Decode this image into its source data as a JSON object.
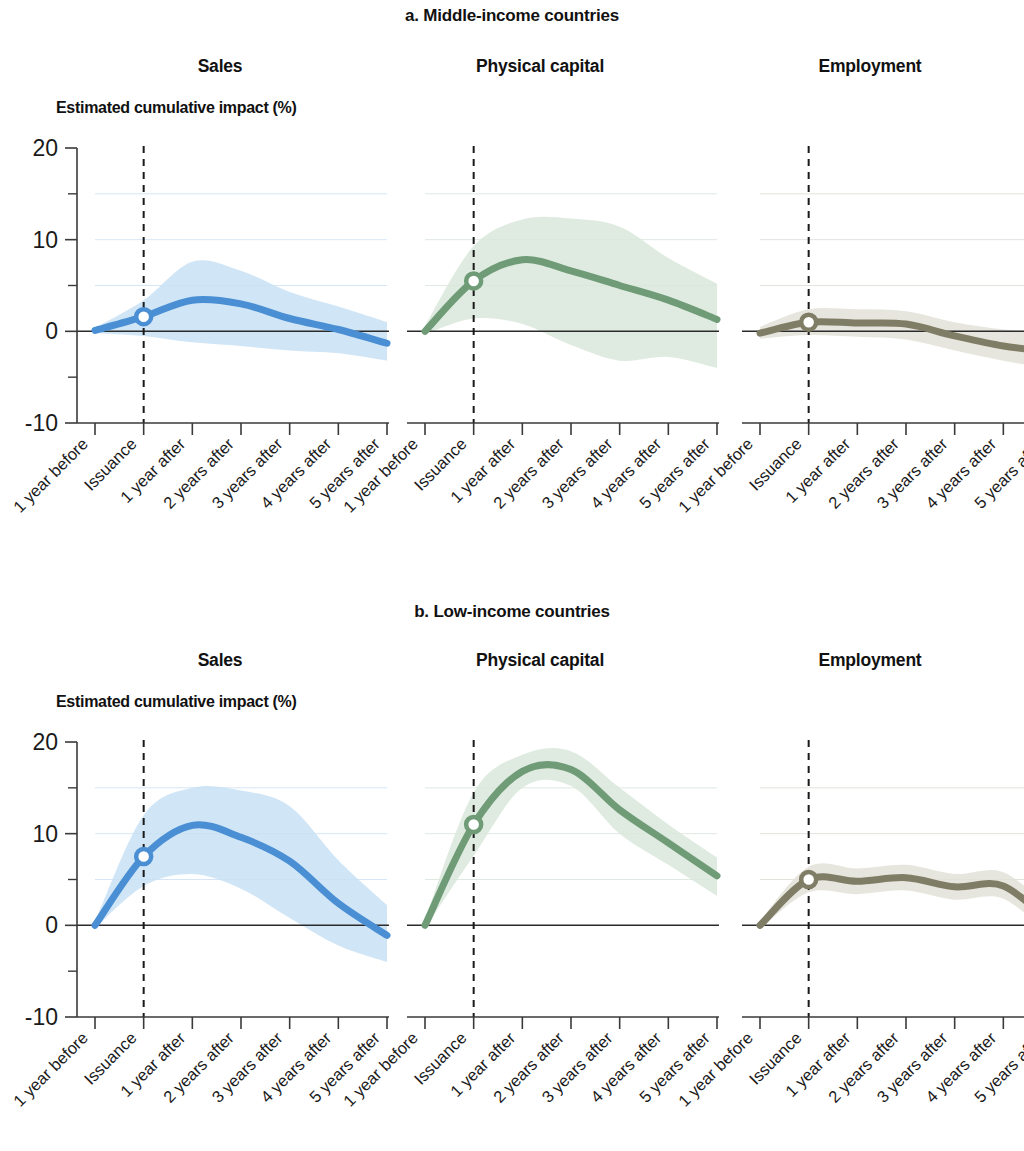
{
  "figure": {
    "sections": [
      {
        "id": "a",
        "title": "a. Middle-income countries"
      },
      {
        "id": "b",
        "title": "b. Low-income countries"
      }
    ],
    "axis_caption": "Estimated cumulative impact (%)",
    "panel_titles": [
      "Sales",
      "Physical capital",
      "Employment"
    ]
  },
  "colors": {
    "sales_line": "#4a8fd4",
    "sales_band": "#c8e1f5",
    "capital_line": "#6f9b77",
    "capital_band": "#d9e8da",
    "employment_line": "#807d66",
    "employment_band": "#e3e2d8",
    "axis": "#3a3a3a",
    "event_line": "#1a1a1a"
  },
  "chart_data": [
    {
      "type": "line",
      "title": "Sales",
      "section": "a. Middle-income countries",
      "xlabel": "",
      "ylabel": "Estimated cumulative impact (%)",
      "ylim": [
        -10,
        20
      ],
      "yticks": [
        -10,
        0,
        10,
        20
      ],
      "yticks_minor": [
        -5,
        5,
        15
      ],
      "grid": true,
      "legend": "none",
      "categories": [
        "1 year before",
        "Issuance",
        "1 year after",
        "2 years after",
        "3 years after",
        "4 years after",
        "5 years after"
      ],
      "x": [
        0,
        1,
        2,
        3,
        4,
        5,
        6
      ],
      "event_marker_x": 1,
      "event_marker_label": "Issuance",
      "series": [
        {
          "name": "Estimated cumulative impact",
          "values": [
            0.1,
            1.6,
            3.4,
            3.0,
            1.4,
            0.2,
            -1.3
          ]
        },
        {
          "name": "Upper confidence bound",
          "values": [
            0.4,
            3.4,
            7.6,
            6.6,
            4.3,
            2.7,
            1.0
          ]
        },
        {
          "name": "Lower confidence bound",
          "values": [
            -0.2,
            -0.5,
            -1.2,
            -1.6,
            -2.1,
            -2.4,
            -3.2
          ]
        }
      ]
    },
    {
      "type": "line",
      "title": "Physical capital",
      "section": "a. Middle-income countries",
      "xlabel": "",
      "ylabel": "Estimated cumulative impact (%)",
      "ylim": [
        -10,
        20
      ],
      "yticks": [
        -10,
        0,
        10,
        20
      ],
      "yticks_minor": [
        -5,
        5,
        15
      ],
      "grid": true,
      "legend": "none",
      "categories": [
        "1 year before",
        "Issuance",
        "1 year after",
        "2 years after",
        "3 years after",
        "4 years after",
        "5 years after"
      ],
      "x": [
        0,
        1,
        2,
        3,
        4,
        5,
        6
      ],
      "event_marker_x": 1,
      "event_marker_label": "Issuance",
      "series": [
        {
          "name": "Estimated cumulative impact",
          "values": [
            0.0,
            5.5,
            7.8,
            6.6,
            5.0,
            3.4,
            1.3
          ]
        },
        {
          "name": "Upper confidence bound",
          "values": [
            0.6,
            9.3,
            12.2,
            12.3,
            11.4,
            8.0,
            5.2
          ]
        },
        {
          "name": "Lower confidence bound",
          "values": [
            -0.3,
            1.4,
            0.8,
            -1.5,
            -3.2,
            -2.8,
            -4.0
          ]
        }
      ]
    },
    {
      "type": "line",
      "title": "Employment",
      "section": "a. Middle-income countries",
      "xlabel": "",
      "ylabel": "Estimated cumulative impact (%)",
      "ylim": [
        -10,
        20
      ],
      "yticks": [
        -10,
        0,
        10,
        20
      ],
      "yticks_minor": [
        -5,
        5,
        15
      ],
      "grid": true,
      "legend": "none",
      "categories": [
        "1 year before",
        "Issuance",
        "1 year after",
        "2 years after",
        "3 years after",
        "4 years after",
        "5 years after"
      ],
      "x": [
        0,
        1,
        2,
        3,
        4,
        5,
        6
      ],
      "event_marker_x": 1,
      "event_marker_label": "Issuance",
      "series": [
        {
          "name": "Estimated cumulative impact",
          "values": [
            -0.2,
            1.0,
            0.9,
            0.8,
            -0.5,
            -1.6,
            -2.2
          ]
        },
        {
          "name": "Upper confidence bound",
          "values": [
            0.5,
            2.4,
            2.4,
            2.2,
            1.0,
            0.2,
            -0.2
          ]
        },
        {
          "name": "Lower confidence bound",
          "values": [
            -0.8,
            -0.4,
            -0.6,
            -0.9,
            -2.1,
            -3.2,
            -4.1
          ]
        }
      ]
    },
    {
      "type": "line",
      "title": "Sales",
      "section": "b. Low-income countries",
      "xlabel": "",
      "ylabel": "Estimated cumulative impact (%)",
      "ylim": [
        -10,
        20
      ],
      "yticks": [
        -10,
        0,
        10,
        20
      ],
      "yticks_minor": [
        -5,
        5,
        15
      ],
      "grid": true,
      "legend": "none",
      "categories": [
        "1 year before",
        "Issuance",
        "1 year after",
        "2 years after",
        "3 years after",
        "4 years after",
        "5 years after"
      ],
      "x": [
        0,
        1,
        2,
        3,
        4,
        5,
        6
      ],
      "event_marker_x": 1,
      "event_marker_label": "Issuance",
      "series": [
        {
          "name": "Estimated cumulative impact",
          "values": [
            0.0,
            7.5,
            10.9,
            9.6,
            7.0,
            2.4,
            -1.1
          ]
        },
        {
          "name": "Upper confidence bound",
          "values": [
            0.4,
            12.0,
            15.0,
            14.7,
            13.0,
            7.1,
            2.2
          ]
        },
        {
          "name": "Lower confidence bound",
          "values": [
            -0.3,
            4.3,
            5.6,
            4.0,
            0.8,
            -2.2,
            -4.0
          ]
        }
      ]
    },
    {
      "type": "line",
      "title": "Physical capital",
      "section": "b. Low-income countries",
      "xlabel": "",
      "ylabel": "Estimated cumulative impact (%)",
      "ylim": [
        -10,
        20
      ],
      "yticks": [
        -10,
        0,
        10,
        20
      ],
      "yticks_minor": [
        -5,
        5,
        15
      ],
      "grid": true,
      "legend": "none",
      "categories": [
        "1 year before",
        "Issuance",
        "1 year after",
        "2 years after",
        "3 years after",
        "4 years after",
        "5 years after"
      ],
      "x": [
        0,
        1,
        2,
        3,
        4,
        5,
        6
      ],
      "event_marker_x": 1,
      "event_marker_label": "Issuance",
      "series": [
        {
          "name": "Estimated cumulative impact",
          "values": [
            0.0,
            11.0,
            16.8,
            17.0,
            12.6,
            9.0,
            5.4
          ]
        },
        {
          "name": "Upper confidence bound",
          "values": [
            0.6,
            14.5,
            18.6,
            19.0,
            15.0,
            11.0,
            7.4
          ]
        },
        {
          "name": "Lower confidence bound",
          "values": [
            -0.3,
            7.6,
            15.0,
            15.2,
            10.0,
            6.6,
            3.2
          ]
        }
      ]
    },
    {
      "type": "line",
      "title": "Employment",
      "section": "b. Low-income countries",
      "xlabel": "",
      "ylabel": "Estimated cumulative impact (%)",
      "ylim": [
        -10,
        20
      ],
      "yticks": [
        -10,
        0,
        10,
        20
      ],
      "yticks_minor": [
        -5,
        5,
        15
      ],
      "grid": true,
      "legend": "none",
      "categories": [
        "1 year before",
        "Issuance",
        "1 year after",
        "2 years after",
        "3 years after",
        "4 years after",
        "5 years after"
      ],
      "x": [
        0,
        1,
        2,
        3,
        4,
        5,
        6
      ],
      "event_marker_x": 1,
      "event_marker_label": "Issuance",
      "series": [
        {
          "name": "Estimated cumulative impact",
          "values": [
            0.0,
            5.0,
            4.8,
            5.2,
            4.2,
            4.3,
            0.1
          ]
        },
        {
          "name": "Upper confidence bound",
          "values": [
            0.5,
            6.4,
            6.2,
            6.6,
            5.6,
            5.8,
            1.6
          ]
        },
        {
          "name": "Lower confidence bound",
          "values": [
            -0.4,
            3.6,
            3.4,
            3.8,
            2.8,
            2.9,
            -1.4
          ]
        }
      ]
    }
  ]
}
